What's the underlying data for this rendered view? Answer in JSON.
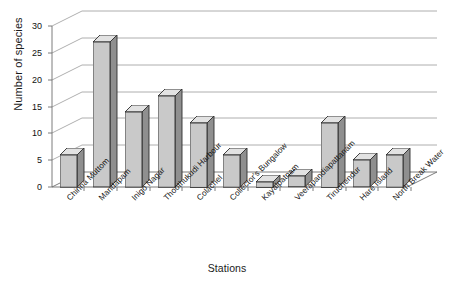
{
  "chart_data": {
    "type": "bar",
    "title": "",
    "xlabel": "Stations",
    "ylabel": "Number of species",
    "categories": [
      "Chinna Muttom",
      "Mandapam",
      "Inigo Nagar",
      "Thoothukudi Harbour",
      "Colachel",
      "Collector's Bungalow",
      "Kayalpatnam",
      "Veerapandiapattanam",
      "Tiruchendur",
      "Hare Island",
      "North Break Water"
    ],
    "values": [
      6,
      27,
      14,
      17,
      12,
      6,
      1,
      2,
      12,
      5,
      6
    ],
    "ylim": [
      0,
      30
    ],
    "yticks": [
      0,
      5,
      10,
      15,
      20,
      25,
      30
    ],
    "ytick_labels": [
      "0",
      "5",
      "10",
      "15",
      "20",
      "25",
      "30"
    ],
    "grid": true,
    "legend": "none",
    "style": "3d-column",
    "colors": {
      "bar_front": "#c9c9c9",
      "bar_side": "#8f8f8f",
      "bar_top": "#e2e2e2",
      "bar_outline": "#2e2e2e",
      "gridline": "#9a9a9a",
      "axis": "#6e6e6e",
      "text": "#151515",
      "background": "#ffffff"
    }
  }
}
